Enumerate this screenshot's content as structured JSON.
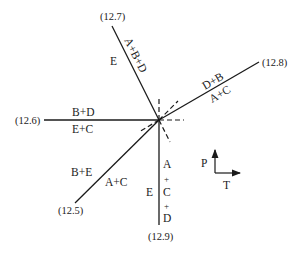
{
  "diagram": {
    "invariant_point": {
      "x": 159,
      "y": 120
    },
    "reactions": [
      {
        "id": "12.7",
        "label": "(12.7)",
        "side_left": "E",
        "side_right": "A+B+D",
        "end": {
          "x": 112,
          "y": 26
        }
      },
      {
        "id": "12.8",
        "label": "(12.8)",
        "side_left": "D+B",
        "side_right": "A+C",
        "end": {
          "x": 259,
          "y": 62
        }
      },
      {
        "id": "12.6",
        "label": "(12.6)",
        "side_left": "B+D",
        "side_right": "E+C",
        "end": {
          "x": 44,
          "y": 120
        }
      },
      {
        "id": "12.5",
        "label": "(12.5)",
        "side_left": "B+E",
        "side_right": "A+C",
        "end": {
          "x": 75,
          "y": 203
        }
      },
      {
        "id": "12.9",
        "label": "(12.9)",
        "side_left": "E",
        "side_right": "A\n+\nC\n+\nD",
        "end": {
          "x": 160,
          "y": 225
        }
      }
    ],
    "axes": {
      "y_label": "P",
      "x_label": "T"
    },
    "colors": {
      "line": "#1a1a1a",
      "text": "#222222",
      "background": "#ffffff"
    }
  },
  "labels": {
    "r127_point": "(12.7)",
    "r127_left": "E",
    "r127_right": "A+B+D",
    "r128_point": "(12.8)",
    "r128_top": "D+B",
    "r128_bottom": "A+C",
    "r126_point": "(12.6)",
    "r126_top": "B+D",
    "r126_bottom": "E+C",
    "r125_point": "(12.5)",
    "r125_left": "B+E",
    "r125_right": "A+C",
    "r129_point": "(12.9)",
    "r129_left": "E",
    "r129_right_1": "A",
    "r129_right_2": "+",
    "r129_right_3": "C",
    "r129_right_4": "+",
    "r129_right_5": "D",
    "axis_p": "P",
    "axis_t": "T"
  }
}
